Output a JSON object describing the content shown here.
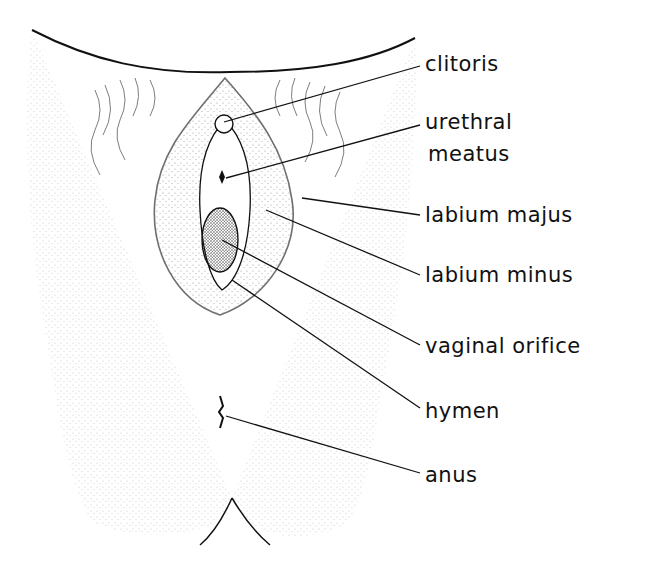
{
  "figure": {
    "labels": [
      {
        "id": "clitoris",
        "text": "clitoris",
        "x": 425,
        "y": 52,
        "line": {
          "x1": 224,
          "y1": 122,
          "x2": 420,
          "y2": 66
        }
      },
      {
        "id": "urethral-meatus",
        "text": "urethral",
        "text2": "meatus",
        "x": 425,
        "y": 110,
        "line": {
          "x1": 226,
          "y1": 178,
          "x2": 420,
          "y2": 125
        }
      },
      {
        "id": "labium-majus",
        "text": "labium majus",
        "x": 425,
        "y": 203,
        "line": {
          "x1": 302,
          "y1": 198,
          "x2": 420,
          "y2": 215
        }
      },
      {
        "id": "labium-minus",
        "text": "labium minus",
        "x": 425,
        "y": 263,
        "line": {
          "x1": 266,
          "y1": 210,
          "x2": 420,
          "y2": 275
        }
      },
      {
        "id": "vaginal-orifice",
        "text": "vaginal orifice",
        "x": 425,
        "y": 334,
        "line": {
          "x1": 222,
          "y1": 240,
          "x2": 420,
          "y2": 345
        }
      },
      {
        "id": "hymen",
        "text": "hymen",
        "x": 425,
        "y": 399,
        "line": {
          "x1": 232,
          "y1": 280,
          "x2": 420,
          "y2": 408
        }
      },
      {
        "id": "anus",
        "text": "anus",
        "x": 425,
        "y": 463,
        "line": {
          "x1": 226,
          "y1": 416,
          "x2": 420,
          "y2": 473
        }
      }
    ],
    "colors": {
      "ink": "#111111",
      "stipple": "#555555",
      "background": "#ffffff"
    }
  }
}
